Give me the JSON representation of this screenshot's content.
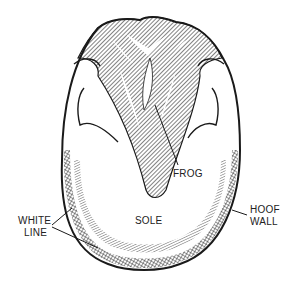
{
  "diagram": {
    "labels": {
      "frog": "FROG",
      "sole": "SOLE",
      "white_line_1": "WHITE",
      "white_line_2": "LINE",
      "hoof_wall_1": "HOOF",
      "hoof_wall_2": "WALL"
    },
    "colors": {
      "ink": "#1a1a1a",
      "background": "#ffffff"
    }
  }
}
